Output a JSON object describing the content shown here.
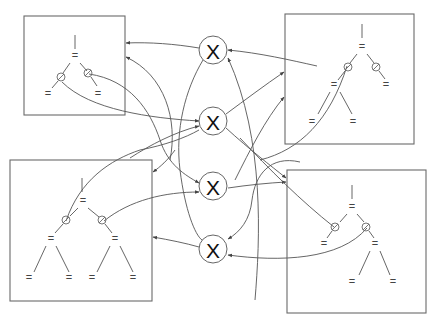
{
  "diagram": {
    "type": "interaction-net",
    "colors": {
      "stroke": "#555555",
      "box": "#6a6a6a",
      "text": "#111111"
    },
    "operator_nodes": [
      {
        "id": "x1",
        "label": "X"
      },
      {
        "id": "x2",
        "label": "X"
      },
      {
        "id": "x3",
        "label": "X"
      },
      {
        "id": "x4",
        "label": "X"
      }
    ],
    "boxes": [
      {
        "id": "top-left",
        "leaf_symbol": "=",
        "ports": 2
      },
      {
        "id": "top-right",
        "leaf_symbol": "=",
        "ports": 2
      },
      {
        "id": "bottom-left",
        "leaf_symbol": "=",
        "ports": 2
      },
      {
        "id": "bottom-right",
        "leaf_symbol": "=",
        "ports": 2
      }
    ],
    "leaf_symbol": "="
  }
}
